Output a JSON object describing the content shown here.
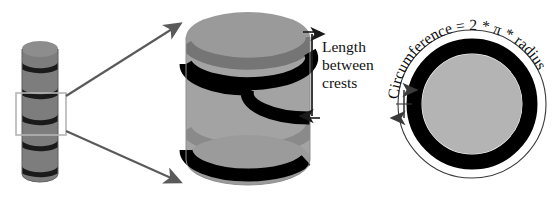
{
  "diagram": {
    "background_color": "#ffffff",
    "small_cylinder": {
      "name": "thin helical cylinder",
      "body_color": "#7d7d7d",
      "top_color": "#8d8d8d",
      "helix_color": "#1a1a1a",
      "turns": 5,
      "selection_box_color": "#b5b5b5"
    },
    "callout": {
      "arrow_color": "#5a5a5a",
      "arrow_count": 2,
      "description": "two arrows magnify the boxed region"
    },
    "large_cylinder": {
      "name": "magnified cylinder",
      "body_color": "#a3a3a3",
      "top_color": "#9a9a9a",
      "shadow_color": "#8e8e8e",
      "helix_front_color": "#000000",
      "helix_back_color": "#6f6f6f",
      "turns": 2
    },
    "dimension": {
      "label_line1": "Length",
      "label_line2": "between",
      "label_line3": "crests",
      "arrow_color": "#1a1a1a",
      "tick_color": "#1a1a1a"
    },
    "cross_section": {
      "name": "circular cross section",
      "formula": "Circumference = 2 * π * radius",
      "outer_circle_color": "#3a3a3a",
      "ring_color": "#000000",
      "disc_color": "#b4b4b4",
      "thickness_arrow_color": "#3a3a3a"
    }
  }
}
